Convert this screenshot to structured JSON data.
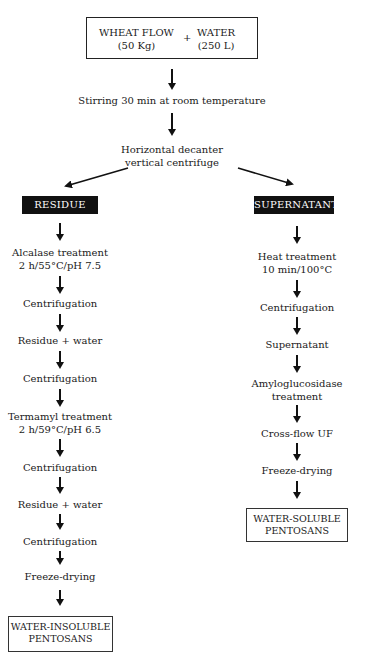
{
  "start": {
    "ingredient1": {
      "name": "WHEAT FLOW",
      "amount": "(50 Kg)"
    },
    "plus": "+",
    "ingredient2": {
      "name": "WATER",
      "amount": "(250 L)"
    }
  },
  "steps_common": [
    "Stirring 30 min at room temperature",
    {
      "line1": "Horizontal decanter",
      "line2": "vertical centrifuge"
    }
  ],
  "branches": {
    "left": {
      "header": "RESIDUE",
      "steps": [
        {
          "line1": "Alcalase treatment",
          "line2": "2 h/55°C/pH 7.5"
        },
        {
          "line1": "Centrifugation"
        },
        {
          "line1": "Residue + water"
        },
        {
          "line1": "Centrifugation"
        },
        {
          "line1": "Termamyl treatment",
          "line2": "2 h/59°C/pH 6.5"
        },
        {
          "line1": "Centrifugation"
        },
        {
          "line1": "Residue + water"
        },
        {
          "line1": "Centrifugation"
        },
        {
          "line1": "Freeze-drying"
        }
      ],
      "result": {
        "line1": "WATER-INSOLUBLE",
        "line2": "PENTOSANS"
      }
    },
    "right": {
      "header": "SUPERNATANT",
      "steps": [
        {
          "line1": "Heat treatment",
          "line2": "10 min/100°C"
        },
        {
          "line1": "Centrifugation"
        },
        {
          "line1": "Supernatant"
        },
        {
          "line1": "Amyloglucosidase",
          "line2": "treatment"
        },
        {
          "line1": "Cross-flow UF"
        },
        {
          "line1": "Freeze-drying"
        }
      ],
      "result": {
        "line1": "WATER-SOLUBLE",
        "line2": "PENTOSANS"
      }
    }
  },
  "colors": {
    "ink": "#111111",
    "header_bg": "#111111",
    "header_text": "#ffffff",
    "background": "#ffffff"
  }
}
